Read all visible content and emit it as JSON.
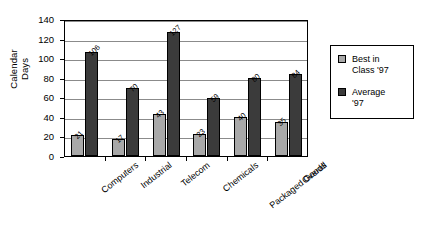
{
  "chart_data": {
    "type": "bar",
    "title": "",
    "xlabel": "",
    "ylabel": "Calendar Days",
    "ylabel_lines": [
      "Calendar",
      "Days"
    ],
    "ylim": [
      0,
      140
    ],
    "ytick_step": 20,
    "yticks": [
      "140",
      "120",
      "100",
      "80",
      "60",
      "40",
      "20",
      "0"
    ],
    "grid": true,
    "legend_position": "right",
    "categories": [
      "Computers",
      "Industrial",
      "Telecom",
      "Chemicals",
      "Packaged Goods",
      "Overall"
    ],
    "series": [
      {
        "name": "Best in Class '97",
        "color": "#a8a8a8",
        "values": [
          21,
          17,
          43,
          23,
          40,
          35
        ]
      },
      {
        "name": "Average '97",
        "color": "#3b3b3b",
        "values": [
          106,
          70,
          127,
          59,
          80,
          84
        ]
      }
    ]
  },
  "legend": {
    "entries": [
      {
        "label": "Best in\nClass '97",
        "swatch": "best"
      },
      {
        "label": "Average\n'97",
        "swatch": "avg"
      }
    ]
  },
  "colors": {
    "best_in_class": "#a8a8a8",
    "average": "#3b3b3b",
    "gridline": "#8b8b8b",
    "axis": "#000000",
    "background": "#ffffff"
  }
}
